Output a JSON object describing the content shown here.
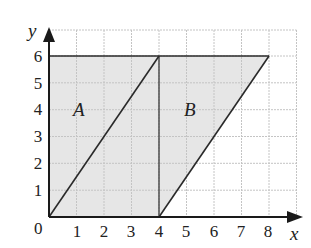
{
  "diagram": {
    "axes": {
      "x_label": "x",
      "y_label": "y",
      "origin_label": "0",
      "x_ticks": [
        "1",
        "2",
        "3",
        "4",
        "5",
        "6",
        "7",
        "8"
      ],
      "y_ticks": [
        "1",
        "2",
        "3",
        "4",
        "5",
        "6"
      ],
      "x_range": [
        0,
        9
      ],
      "y_range": [
        0,
        7
      ]
    },
    "grid": {
      "visible": true,
      "color": "#c8c8c8",
      "style": "dashed"
    },
    "shapes": [
      {
        "label": "A",
        "type": "parallelogram",
        "vertices": [
          [
            0,
            0
          ],
          [
            4,
            0
          ],
          [
            4,
            6
          ],
          [
            0,
            6
          ]
        ],
        "note": "rectangle 0..4 x 0..6, diagonal from (0,0) to (4,6)",
        "fill": "#e6e6e6"
      },
      {
        "label": "B",
        "type": "parallelogram",
        "vertices": [
          [
            4,
            0
          ],
          [
            8,
            6
          ],
          [
            4,
            6
          ]
        ],
        "note": "region between x=4 line and line from (4,0) to (8,6), below y=6",
        "fill": "#e6e6e6"
      }
    ],
    "lines": [
      {
        "from": [
          0,
          0
        ],
        "to": [
          4,
          6
        ]
      },
      {
        "from": [
          4,
          0
        ],
        "to": [
          8,
          6
        ]
      },
      {
        "from": [
          0,
          6
        ],
        "to": [
          8,
          6
        ]
      },
      {
        "from": [
          4,
          0
        ],
        "to": [
          4,
          6
        ]
      }
    ],
    "colors": {
      "shade": "#e6e6e6",
      "line": "#2a2a2a",
      "grid": "#c8c8c8"
    }
  }
}
